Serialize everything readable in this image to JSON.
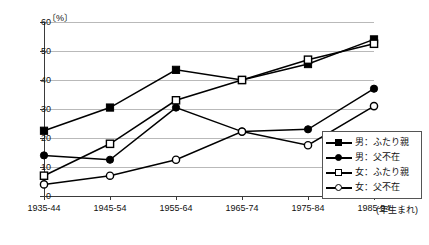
{
  "chart_data": {
    "type": "line",
    "title": "",
    "xlabel": "(年生まれ)",
    "ylabel": "",
    "unit_label": "〔%〕",
    "categories": [
      "1935-44",
      "1945-54",
      "1955-64",
      "1965-74",
      "1975-84",
      "1985-94"
    ],
    "ylim": [
      0,
      60
    ],
    "ytick_labels": [
      "0",
      "10",
      "20",
      "30",
      "40",
      "50",
      "60"
    ],
    "ytick_values": [
      0,
      10,
      20,
      30,
      40,
      50,
      60
    ],
    "grid": true,
    "legend_position": "bottom-right",
    "series": [
      {
        "name": "男：ふたり親",
        "marker": "filled-square",
        "values": [
          22.5,
          30.5,
          43.5,
          40.0,
          45.5,
          54.0
        ]
      },
      {
        "name": "男：父不在",
        "marker": "filled-circle",
        "values": [
          14.0,
          12.5,
          30.5,
          22.2,
          23.0,
          37.0
        ]
      },
      {
        "name": "女：ふたり親",
        "marker": "open-square",
        "values": [
          7.0,
          18.0,
          33.0,
          40.0,
          47.0,
          52.5
        ]
      },
      {
        "name": "女：父不在",
        "marker": "open-circle",
        "values": [
          4.0,
          7.0,
          12.5,
          22.2,
          17.5,
          31.0
        ]
      }
    ]
  },
  "legend": {
    "entries": [
      {
        "label": "男：ふたり親",
        "marker": "filled-square"
      },
      {
        "label": "男：父不在",
        "marker": "filled-circle"
      },
      {
        "label": "女：ふたり親",
        "marker": "open-square"
      },
      {
        "label": "女：父不在",
        "marker": "open-circle"
      }
    ]
  },
  "colors": {
    "series": "#000000",
    "grid": "#b9b9b9",
    "axis": "#3a3a3a",
    "background": "#ffffff"
  }
}
